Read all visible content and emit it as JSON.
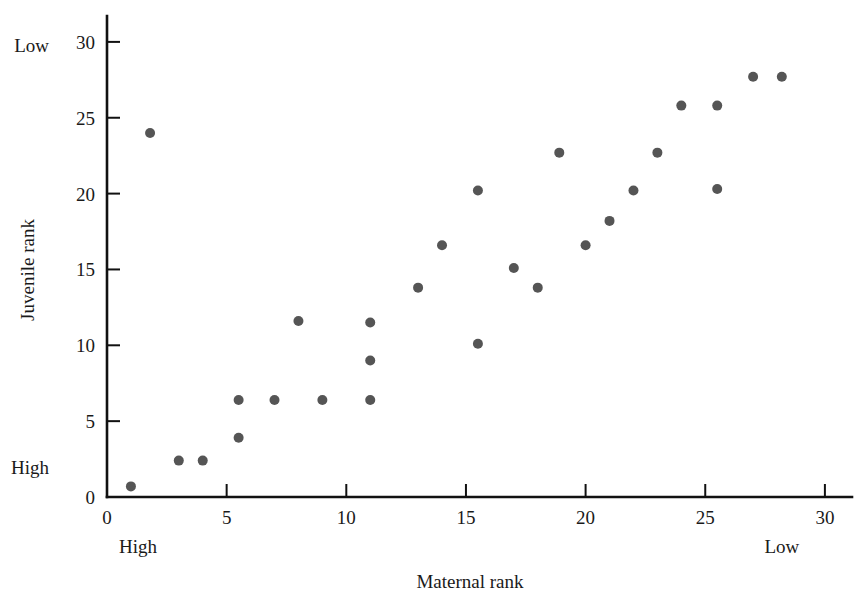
{
  "chart_data": {
    "type": "scatter",
    "title": "",
    "xlabel": "Maternal rank",
    "ylabel": "Juvenile rank",
    "xlim": [
      0,
      31
    ],
    "ylim": [
      0,
      31
    ],
    "grid": false,
    "legend": "none",
    "marker_color": "#555555",
    "marker_size": 10,
    "axis_color": "#111111",
    "x_ticks": [
      0,
      5,
      10,
      15,
      20,
      25,
      30
    ],
    "y_ticks": [
      0,
      5,
      10,
      15,
      20,
      25,
      30
    ],
    "x_tick_labels": [
      "0",
      "5",
      "10",
      "15",
      "20",
      "25",
      "30"
    ],
    "y_tick_labels": [
      "0",
      "5",
      "10",
      "15",
      "20",
      "25",
      "30"
    ],
    "x_end_labels": {
      "low_rank": "High",
      "high_rank": "Low"
    },
    "y_end_labels": {
      "low_rank": "High",
      "high_rank": "Low"
    },
    "annotations": [
      {
        "text": "High",
        "axis": "x",
        "at": 1.3
      },
      {
        "text": "Low",
        "axis": "x",
        "at": 28.2
      },
      {
        "text": "High",
        "axis": "y",
        "at": 2.0
      },
      {
        "text": "Low",
        "axis": "y",
        "at": 29.8
      }
    ],
    "points": [
      {
        "x": 1.0,
        "y": 0.7
      },
      {
        "x": 1.8,
        "y": 24.0
      },
      {
        "x": 3.0,
        "y": 2.4
      },
      {
        "x": 4.0,
        "y": 2.4
      },
      {
        "x": 5.5,
        "y": 3.9
      },
      {
        "x": 5.5,
        "y": 6.4
      },
      {
        "x": 7.0,
        "y": 6.4
      },
      {
        "x": 8.0,
        "y": 11.6
      },
      {
        "x": 9.0,
        "y": 6.4
      },
      {
        "x": 11.0,
        "y": 6.4
      },
      {
        "x": 11.0,
        "y": 9.0
      },
      {
        "x": 11.0,
        "y": 11.5
      },
      {
        "x": 13.0,
        "y": 13.8
      },
      {
        "x": 14.0,
        "y": 16.6
      },
      {
        "x": 15.5,
        "y": 10.1
      },
      {
        "x": 15.5,
        "y": 20.2
      },
      {
        "x": 17.0,
        "y": 15.1
      },
      {
        "x": 18.0,
        "y": 13.8
      },
      {
        "x": 18.9,
        "y": 22.7
      },
      {
        "x": 20.0,
        "y": 16.6
      },
      {
        "x": 21.0,
        "y": 18.2
      },
      {
        "x": 22.0,
        "y": 20.2
      },
      {
        "x": 23.0,
        "y": 22.7
      },
      {
        "x": 24.0,
        "y": 25.8
      },
      {
        "x": 25.5,
        "y": 20.3
      },
      {
        "x": 25.5,
        "y": 25.8
      },
      {
        "x": 27.0,
        "y": 27.7
      },
      {
        "x": 28.2,
        "y": 27.7
      }
    ]
  }
}
